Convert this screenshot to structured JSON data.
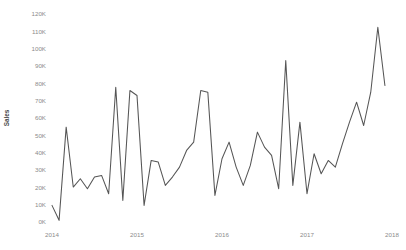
{
  "chart_data": {
    "type": "line",
    "title": "",
    "subtitle": "",
    "xlabel": "",
    "ylabel": "Sales",
    "grid": false,
    "legend": false,
    "legend_position": "none",
    "line_color": "#555555",
    "background_color": "#ffffff",
    "tick_label_color": "#8b8b8b",
    "axis_title_color": "#4a4a4a",
    "xlim": [
      2014.0,
      2018.0
    ],
    "ylim": [
      0,
      125000
    ],
    "y_ticks": [
      0,
      10000,
      20000,
      30000,
      40000,
      50000,
      60000,
      70000,
      80000,
      90000,
      100000,
      110000,
      120000
    ],
    "y_tick_labels": [
      "0K",
      "10K",
      "20K",
      "30K",
      "40K",
      "50K",
      "60K",
      "70K",
      "80K",
      "90K",
      "100K",
      "110K",
      "120K"
    ],
    "x_ticks": [
      2014,
      2015,
      2016,
      2017,
      2018
    ],
    "x_tick_labels": [
      "2014",
      "2015",
      "2016",
      "2017",
      "2018"
    ],
    "x": [
      2014.0,
      2014.0833,
      2014.1667,
      2014.25,
      2014.3333,
      2014.4167,
      2014.5,
      2014.5833,
      2014.6667,
      2014.75,
      2014.8333,
      2014.9167,
      2015.0,
      2015.0833,
      2015.1667,
      2015.25,
      2015.3333,
      2015.4167,
      2015.5,
      2015.5833,
      2015.6667,
      2015.75,
      2015.8333,
      2015.9167,
      2016.0,
      2016.0833,
      2016.1667,
      2016.25,
      2016.3333,
      2016.4167,
      2016.5,
      2016.5833,
      2016.6667,
      2016.75,
      2016.8333,
      2016.9167,
      2017.0,
      2017.0833,
      2017.1667,
      2017.25,
      2017.3333,
      2017.4167,
      2017.5,
      2017.5833,
      2017.6667,
      2017.75,
      2017.8333,
      2017.9167
    ],
    "values": [
      10000,
      1000,
      57000,
      21000,
      26000,
      20000,
      27000,
      28000,
      17000,
      81000,
      13000,
      79000,
      76000,
      10000,
      37000,
      36000,
      22000,
      27000,
      33000,
      43000,
      48000,
      79000,
      78000,
      16000,
      38000,
      48000,
      33000,
      22000,
      34000,
      54000,
      45000,
      40000,
      20000,
      97000,
      22000,
      60000,
      17000,
      41000,
      29000,
      37000,
      33000,
      47000,
      60000,
      72000,
      58000,
      78000,
      117000,
      82000
    ],
    "value_unit": "K",
    "series_name": "Sales",
    "point_count": 48,
    "min_value": 1000,
    "max_value": 117000
  }
}
